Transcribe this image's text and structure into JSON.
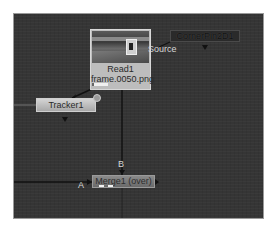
{
  "node_graph": {
    "background": "#353535",
    "nodes": [
      {
        "id": "read",
        "name": "Read1",
        "file": "frame.0050.png",
        "thumbnail": "hallway-image"
      },
      {
        "id": "cornerpin",
        "name": "CornerPin2D1"
      },
      {
        "id": "tracker",
        "name": "Tracker1"
      },
      {
        "id": "merge",
        "name": "Merge1 (over)"
      }
    ],
    "edge_labels": {
      "source": "Source",
      "b_input": "B",
      "a_input": "A"
    }
  }
}
